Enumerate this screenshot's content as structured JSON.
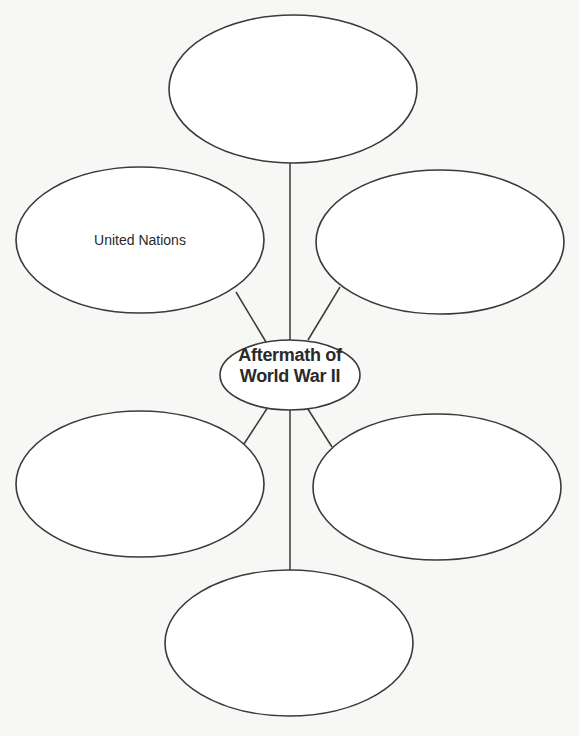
{
  "diagram": {
    "type": "concept-web",
    "center": {
      "label_line1": "Aftermath of",
      "label_line2": "World War II"
    },
    "nodes": [
      {
        "id": "top",
        "label": ""
      },
      {
        "id": "upper-left",
        "label": "United Nations"
      },
      {
        "id": "upper-right",
        "label": ""
      },
      {
        "id": "lower-left",
        "label": ""
      },
      {
        "id": "lower-right",
        "label": ""
      },
      {
        "id": "bottom",
        "label": ""
      }
    ],
    "colors": {
      "stroke": "#3a3a3a",
      "fill": "#ffffff",
      "background": "#f7f7f5",
      "text": "#2a2a2a"
    }
  }
}
